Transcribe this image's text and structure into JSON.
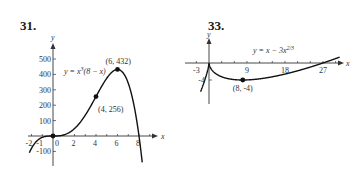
{
  "problems": [
    {
      "number": "31.",
      "equation": "y = x³(8 − x)"
    },
    {
      "number": "33.",
      "equation": "y = x − 3x²ᐟ³"
    }
  ],
  "chart_data": [
    {
      "type": "line",
      "title": "31.",
      "equation": "y = x^3(8 - x)",
      "xlabel": "x",
      "ylabel": "y",
      "x_ticks": [
        "-2",
        "-1",
        "0",
        "2",
        "4",
        "6",
        "8"
      ],
      "y_ticks": [
        "500",
        "400",
        "300",
        "200",
        "100",
        "-100"
      ],
      "xlim": [
        -2.5,
        9.5
      ],
      "ylim": [
        -180,
        560
      ],
      "grid": false,
      "points": [
        {
          "x": 0,
          "y": 0,
          "label": ""
        },
        {
          "x": 4,
          "y": 256,
          "label": "(4, 256)"
        },
        {
          "x": 6,
          "y": 432,
          "label": "(6, 432)"
        }
      ],
      "series": [
        {
          "name": "y = x^3(8 - x)",
          "x": [
            -2.2,
            -2,
            -1.5,
            -1,
            -0.5,
            0,
            1,
            2,
            3,
            4,
            5,
            6,
            7,
            7.5,
            8,
            8.3
          ],
          "values": [
            -109,
            -80,
            -32,
            -9,
            -1,
            0,
            7,
            48,
            135,
            256,
            375,
            432,
            343,
            211,
            0,
            -172
          ]
        }
      ]
    },
    {
      "type": "line",
      "title": "33.",
      "equation": "y = x - 3x^(2/3)",
      "xlabel": "x",
      "ylabel": "y",
      "x_ticks": [
        "-3",
        "9",
        "18",
        "27"
      ],
      "y_ticks": [
        "-4"
      ],
      "xlim": [
        -3.5,
        31
      ],
      "ylim": [
        -9,
        6
      ],
      "grid": false,
      "points": [
        {
          "x": 8,
          "y": -4,
          "label": "(8, -4)"
        }
      ],
      "series": [
        {
          "name": "y = x - 3x^(2/3)",
          "x": [
            -2,
            -1,
            -0.3,
            0,
            1,
            2,
            4,
            8,
            12,
            18,
            24,
            27,
            30
          ],
          "values": [
            -6.76,
            -4,
            -1.64,
            0,
            -2,
            -2.76,
            -3.56,
            -4,
            -3.73,
            -2.6,
            -1,
            0,
            1.07
          ]
        }
      ]
    }
  ]
}
